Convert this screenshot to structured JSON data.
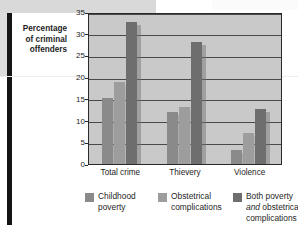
{
  "chart_data": {
    "type": "bar",
    "title": "",
    "subtitle": "",
    "xlabel": "",
    "ylabel": "Percentage\nof criminal\noffenders",
    "ylabel_lines": [
      "Percentage",
      "of criminal",
      "offenders"
    ],
    "categories": [
      "Total crime",
      "Thievery",
      "Violence"
    ],
    "series": [
      {
        "name": "Childhood poverty",
        "values": [
          15.3,
          12.0,
          3.3
        ],
        "color": "#8a8a8a"
      },
      {
        "name": "Obstetrical complications",
        "values": [
          19.0,
          13.2,
          7.2
        ],
        "color": "#9d9d9d"
      },
      {
        "name": "Both poverty and obstetrical complications",
        "values": [
          32.8,
          28.2,
          12.6
        ],
        "color": "#6e6e6e"
      }
    ],
    "ylim": [
      0,
      35
    ],
    "yticks": [
      35,
      30,
      25,
      20,
      15,
      10,
      5,
      0
    ],
    "ytick_labels": [
      "35",
      "30",
      "25",
      "20",
      "15",
      "10",
      "5",
      "0"
    ],
    "grid": true,
    "grid_axis": "y",
    "legend_position": "bottom",
    "plot_background": "#c9c9c9"
  },
  "legend": {
    "entries": [
      {
        "label_line1": "Childhood",
        "label_line2": "poverty",
        "label_line3": "",
        "italic_word": ""
      },
      {
        "label_line1": "Obstetrical",
        "label_line2": "complications",
        "label_line3": "",
        "italic_word": ""
      },
      {
        "label_line1": "Both poverty",
        "label_line2_italic": "and",
        "label_line2_rest": " obstetrical",
        "label_line3": "complications",
        "italic_word": "and"
      }
    ]
  }
}
